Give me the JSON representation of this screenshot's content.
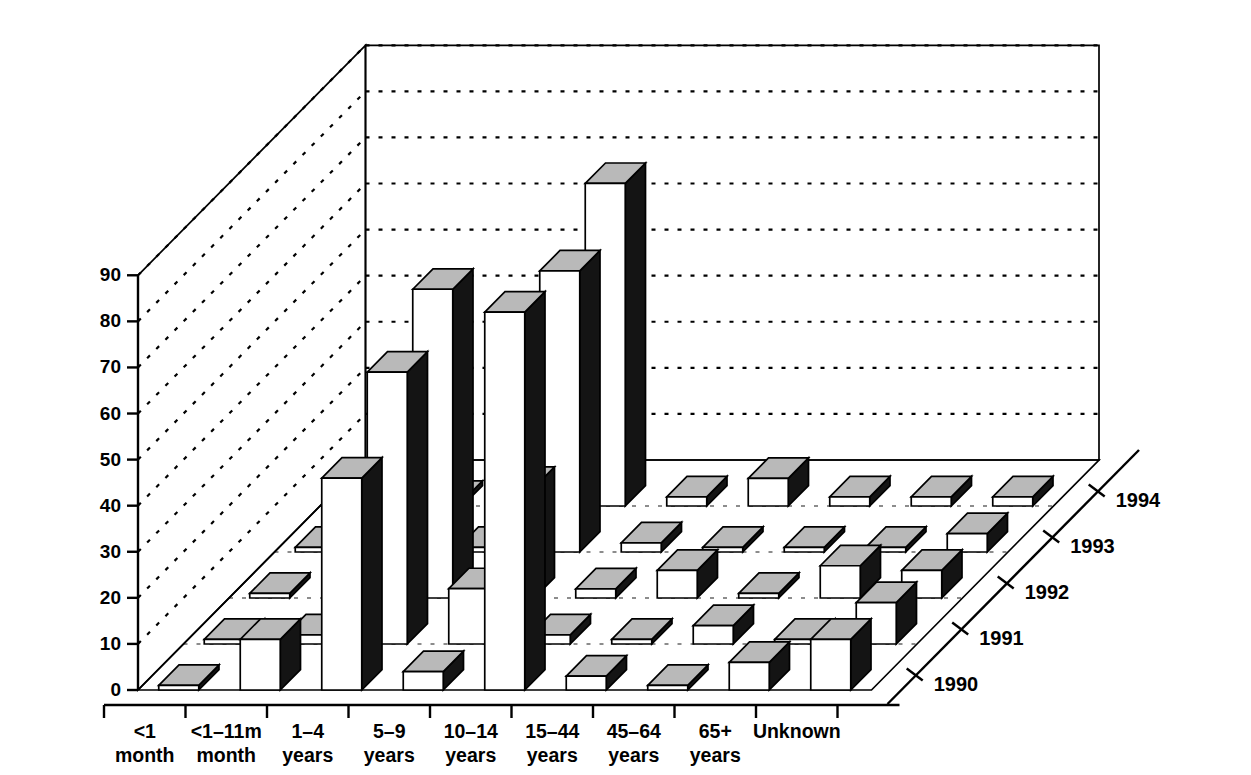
{
  "chart_data": {
    "type": "bar",
    "title": "",
    "subtitle": "",
    "xlabel": "",
    "ylabel": "",
    "zlabel": "",
    "ylim": [
      0,
      90
    ],
    "ytick_step": 10,
    "yticks": [
      "0",
      "10",
      "20",
      "30",
      "40",
      "50",
      "60",
      "70",
      "80",
      "90"
    ],
    "grid": true,
    "legend_position": "none",
    "projection": "3d-isometric",
    "categories": [
      "<1\nmonth",
      "<1–11m\nmonth",
      "1–4\nyears",
      "5–9\nyears",
      "10–14\nyears",
      "15–44\nyears",
      "45–64\nyears",
      "65+\nyears",
      "Unknown"
    ],
    "category_labels": [
      [
        "<1",
        "month"
      ],
      [
        "<1–11m",
        "month"
      ],
      [
        "1–4",
        "years"
      ],
      [
        "5–9",
        "years"
      ],
      [
        "10–14",
        "years"
      ],
      [
        "15–44",
        "years"
      ],
      [
        "45–64",
        "years"
      ],
      [
        "65+",
        "years"
      ],
      [
        "Unknown",
        ""
      ]
    ],
    "depth_axis_name": "year",
    "depth_categories": [
      "1990",
      "1991",
      "1992",
      "1993",
      "1994"
    ],
    "series": [
      {
        "name": "1990",
        "values": [
          1,
          11,
          46,
          4,
          82,
          3,
          1,
          6,
          11
        ]
      },
      {
        "name": "1991",
        "values": [
          1,
          2,
          59,
          12,
          2,
          1,
          4,
          1,
          9
        ]
      },
      {
        "name": "1992",
        "values": [
          1,
          2,
          67,
          24,
          2,
          6,
          1,
          7,
          6
        ]
      },
      {
        "name": "1993",
        "values": [
          1,
          2,
          1,
          61,
          2,
          1,
          1,
          1,
          4
        ]
      },
      {
        "name": "1994",
        "values": [
          1,
          1,
          1,
          70,
          2,
          6,
          2,
          2,
          2
        ]
      }
    ],
    "colors": {
      "bar_front": "#ffffff",
      "bar_top": "#b9b9b9",
      "bar_side": "#141414",
      "axis": "#000000",
      "grid": "#000000",
      "background": "#ffffff"
    }
  }
}
